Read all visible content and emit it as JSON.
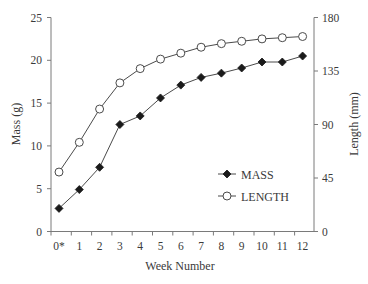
{
  "chart_data": {
    "type": "line",
    "title": "",
    "xlabel": "Week Number",
    "ylabel": "Mass (g)",
    "y2label": "Length (mm)",
    "categories": [
      "0*",
      "1",
      "2",
      "3",
      "4",
      "5",
      "6",
      "7",
      "8",
      "9",
      "10",
      "11",
      "12"
    ],
    "ylim": [
      0,
      25
    ],
    "y2lim": [
      0,
      180
    ],
    "yticks": [
      0,
      5,
      10,
      15,
      20,
      25
    ],
    "y2ticks": [
      0,
      45,
      90,
      135,
      180
    ],
    "grid": false,
    "legend_position": "lower right inside",
    "series": [
      {
        "name": "MASS",
        "axis": "left",
        "marker": "filled-diamond",
        "values": [
          2.7,
          4.9,
          7.5,
          12.5,
          13.5,
          15.6,
          17.1,
          18.0,
          18.5,
          19.1,
          19.8,
          19.8,
          20.5
        ]
      },
      {
        "name": "LENGTH",
        "axis": "right",
        "marker": "open-circle",
        "values": [
          50,
          75,
          103,
          125,
          137,
          145,
          150,
          155,
          158,
          160,
          162,
          163,
          164
        ]
      }
    ]
  },
  "colors": {
    "axis": "#7a7a7a",
    "line": "#4a4a4a",
    "marker_fill_mass": "#1a1a1a",
    "marker_fill_length": "#ffffff",
    "text": "#3a3a3a"
  }
}
